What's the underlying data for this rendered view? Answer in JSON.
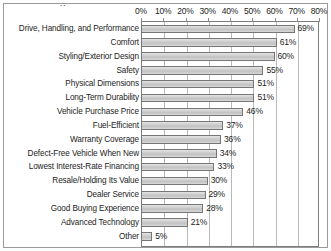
{
  "figure": {
    "title_remnant": "y",
    "frame_color": "#9a9a9a",
    "bar_fill_color": "#cfcfcf",
    "bar_border_color": "#767676",
    "gridline_color": "#b8b8b8",
    "axis_color": "#7d7d7d",
    "text_color": "#1d1d1d"
  },
  "chart_data": {
    "type": "bar",
    "orientation": "horizontal",
    "title": "",
    "xlabel": "",
    "ylabel": "",
    "xlim": [
      0,
      80
    ],
    "xtick_labels": [
      "0%",
      "10%",
      "20%",
      "30%",
      "40%",
      "50%",
      "60%",
      "70%",
      "80%"
    ],
    "xticks": [
      0,
      10,
      20,
      30,
      40,
      50,
      60,
      70,
      80
    ],
    "grid": true,
    "legend": false,
    "categories": [
      "Drive, Handling, and Performance",
      "Comfort",
      "Styling/Exterior Design",
      "Safety",
      "Physical Dimensions",
      "Long-Term Durability",
      "Vehicle Purchase Price",
      "Fuel-Efficient",
      "Warranty Coverage",
      "Defect-Free Vehicle When New",
      "Lowest Interest-Rate Financing",
      "Resale/Holding Its Value",
      "Dealer Service",
      "Good Buying Experience",
      "Advanced Technology",
      "Other"
    ],
    "values": [
      69,
      61,
      60,
      55,
      51,
      51,
      46,
      37,
      36,
      34,
      33,
      30,
      29,
      28,
      21,
      5
    ],
    "value_labels": [
      "69%",
      "61%",
      "60%",
      "55%",
      "51%",
      "51%",
      "46%",
      "37%",
      "36%",
      "34%",
      "33%",
      "30%",
      "29%",
      "28%",
      "21%",
      "5%"
    ]
  }
}
